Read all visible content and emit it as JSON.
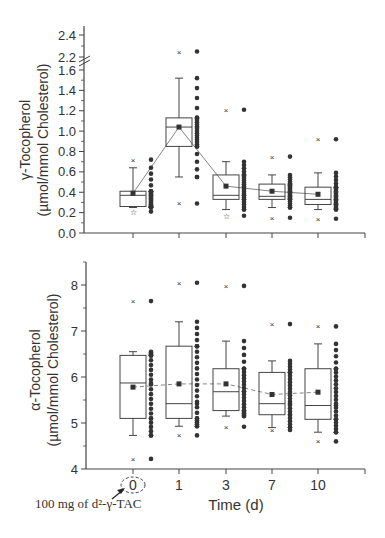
{
  "chart_data": [
    {
      "type": "box",
      "title": "",
      "xlabel": "",
      "ylabel": "γ-Tocopherol",
      "ylabel2": "(µmol/mmol Cholesterol)",
      "categories": [
        "0",
        "1",
        "3",
        "7",
        "10"
      ],
      "y_ticks": [
        "0.0",
        "0.2",
        "0.4",
        "0.6",
        "0.8",
        "1.0",
        "1.2",
        "1.4",
        "1.6",
        "2.2",
        "2.4"
      ],
      "axis_break": [
        1.6,
        2.2
      ],
      "ylim": [
        0.0,
        2.45
      ],
      "grid": false,
      "series": [
        {
          "name": "box",
          "q1": [
            0.26,
            0.85,
            0.33,
            0.33,
            0.28
          ],
          "median": [
            0.37,
            1.04,
            0.37,
            0.36,
            0.33
          ],
          "q3": [
            0.41,
            1.13,
            0.57,
            0.48,
            0.45
          ],
          "whisker_low": [
            0.25,
            0.55,
            0.23,
            0.25,
            0.23
          ],
          "whisker_high": [
            0.64,
            1.52,
            0.7,
            0.57,
            0.59
          ]
        },
        {
          "name": "mean",
          "values": [
            0.39,
            1.04,
            0.46,
            0.41,
            0.38
          ]
        },
        {
          "name": "max_outlier",
          "values": [
            0.72,
            2.25,
            1.21,
            0.75,
            0.92
          ]
        },
        {
          "name": "min_outlier",
          "values": [
            0.21,
            0.29,
            0.17,
            0.15,
            0.14
          ]
        }
      ]
    },
    {
      "type": "box",
      "title": "",
      "xlabel": "Time (d)",
      "ylabel": "α-Tocopherol",
      "ylabel2": "(µmol/mmol Cholesterol)",
      "categories": [
        "0",
        "1",
        "3",
        "7",
        "10"
      ],
      "y_ticks": [
        "4",
        "5",
        "6",
        "7",
        "8"
      ],
      "ylim": [
        4,
        8.5
      ],
      "grid": false,
      "series": [
        {
          "name": "box",
          "q1": [
            5.1,
            5.1,
            5.27,
            5.18,
            5.08
          ],
          "median": [
            5.87,
            5.42,
            5.68,
            5.42,
            5.38
          ],
          "q3": [
            6.47,
            6.67,
            6.18,
            6.1,
            6.18
          ],
          "whisker_low": [
            4.73,
            4.93,
            5.15,
            4.9,
            4.8
          ],
          "whisker_high": [
            6.55,
            7.2,
            6.78,
            6.35,
            6.72
          ]
        },
        {
          "name": "mean",
          "values": [
            5.78,
            5.85,
            5.85,
            5.62,
            5.67
          ]
        },
        {
          "name": "max_outlier",
          "values": [
            7.65,
            8.05,
            7.98,
            7.15,
            7.1
          ]
        },
        {
          "name": "min_outlier",
          "values": [
            4.22,
            4.73,
            4.92,
            4.85,
            4.6
          ]
        }
      ]
    }
  ],
  "top": {
    "ylabel": "γ-Tocopherol",
    "ylabel2": "(µmol/mmol Cholesterol)"
  },
  "bottom": {
    "ylabel": "α-Tocopherol",
    "ylabel2": "(µmol/mmol Cholesterol)",
    "xlabel": "Time (d)"
  },
  "annotation": {
    "dose": "100 mg of d²-γ-TAC"
  }
}
